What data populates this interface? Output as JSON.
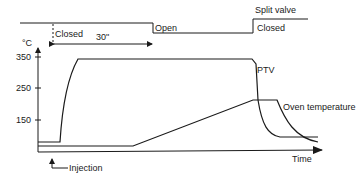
{
  "split_valve": {
    "title": "Split valve",
    "states": [
      "Closed",
      "Open",
      "Closed"
    ],
    "duration_label": "30\""
  },
  "axes": {
    "y_unit": "°C",
    "y_ticks": [
      "350",
      "250",
      "150"
    ],
    "x_label": "Time"
  },
  "curves": {
    "ptv_label": "PTV",
    "oven_label": "Oven temperature"
  },
  "annotations": {
    "injection_label": "Injection"
  },
  "colors": {
    "line": "#1a1a1a",
    "background": "#ffffff"
  }
}
